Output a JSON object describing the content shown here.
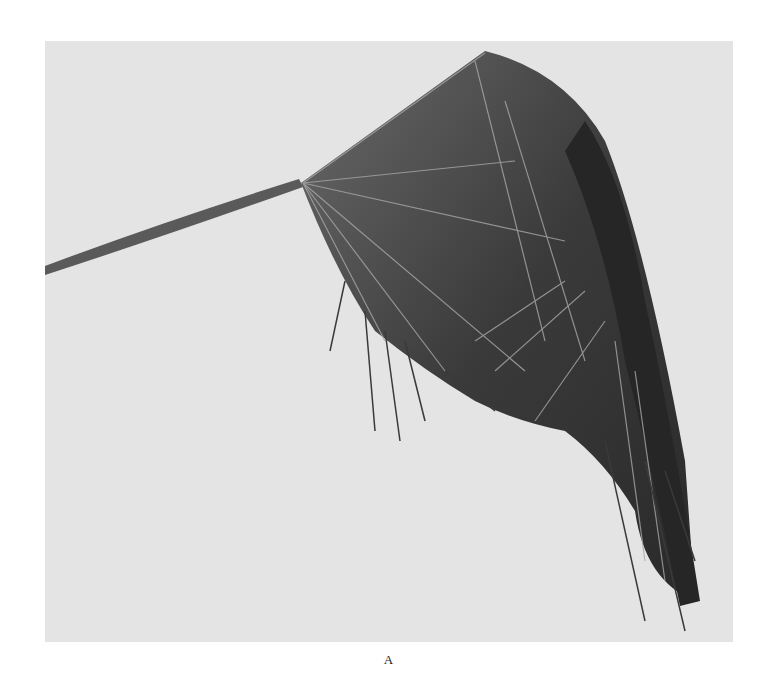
{
  "figure": {
    "rendering": "grayscale halftone photograph",
    "caption": "A",
    "colors": {
      "background": "#ffffff",
      "photo_background": "#e4e4e4",
      "leaf_dark": "#2e2e2e",
      "leaf_mid": "#555555",
      "leaf_highlight": "#bdbdbd",
      "stem": "#5a5a5a"
    }
  }
}
